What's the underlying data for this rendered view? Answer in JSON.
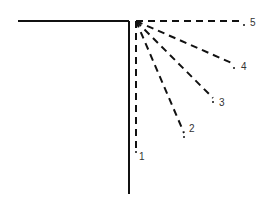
{
  "diagram": {
    "corner": {
      "horizontal": {
        "x1": 18,
        "y1": 21,
        "x2": 129,
        "y2": 21
      },
      "vertical": {
        "x1": 129,
        "y1": 21,
        "x2": 129,
        "y2": 194
      }
    },
    "origin": {
      "x": 136,
      "y": 21
    },
    "rays": [
      {
        "label": "1",
        "x": 136,
        "y": 148,
        "lx": 139,
        "ly": 160
      },
      {
        "label": "2",
        "x": 184,
        "y": 133,
        "lx": 189,
        "ly": 132
      },
      {
        "label": "3",
        "x": 213,
        "y": 98,
        "lx": 219,
        "ly": 106
      },
      {
        "label": "4",
        "x": 234,
        "y": 64,
        "lx": 241,
        "ly": 70
      },
      {
        "label": "5",
        "x": 244,
        "y": 21,
        "lx": 250,
        "ly": 26
      }
    ]
  }
}
